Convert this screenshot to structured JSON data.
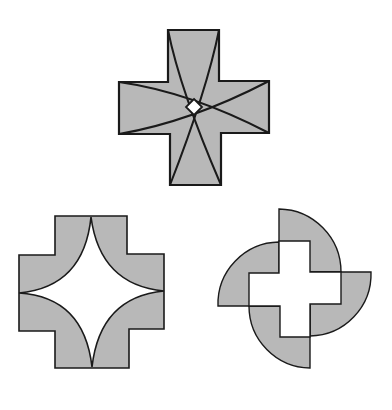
{
  "figure": {
    "colors": {
      "fill": "#b8b8b8",
      "stroke": "#1a1a1a",
      "hole": "#ffffff",
      "background": "#ffffff"
    },
    "shapes": [
      {
        "id": "cross-with-arcs",
        "label": "Plus-shaped cross with four intersecting arcs and a small central diamond hole"
      },
      {
        "id": "cross-with-astroid-hole",
        "label": "Plus-shaped cross with a concave four-pointed star cut out of the center"
      },
      {
        "id": "pinwheel-cross",
        "label": "Hollow plus shape surrounded by four quarter-circle blades forming a pinwheel"
      }
    ]
  }
}
